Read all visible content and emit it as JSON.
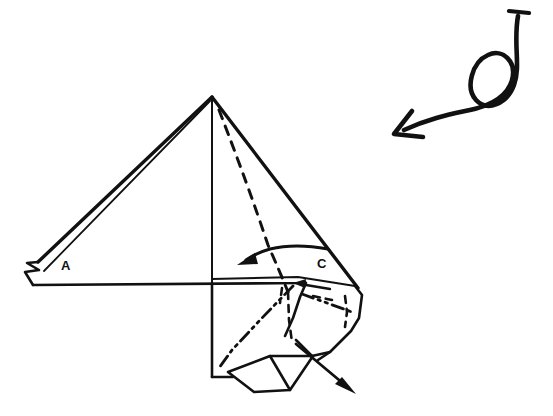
{
  "figure": {
    "kind": "origami-folding-diagram",
    "background_color": "#ffffff",
    "ink_color": "#111111",
    "width": 553,
    "height": 416
  },
  "labels": [
    {
      "name": "point-label-a",
      "text": "A",
      "x": 61,
      "y": 270
    },
    {
      "name": "point-label-c",
      "text": "C",
      "x": 317,
      "y": 268
    }
  ],
  "annotations": {
    "turn_over_arrow": {
      "name": "turn-over-looped-arrow",
      "description": "looped rotate / turn-over arrow",
      "tail_cap": "t-bar",
      "head_style": "open-v",
      "direction": "down-left"
    },
    "fold_arrow": {
      "name": "fold-left-curved-arrow",
      "description": "curved arrow indicating flap folds to the left",
      "head_style": "solid-triangle",
      "direction": "left"
    },
    "pull_arrow": {
      "name": "pull-out-arrow",
      "description": "straight arrow indicating flap pulled out to lower right",
      "head_style": "solid-triangle",
      "direction": "down-right"
    }
  },
  "line_styles": {
    "solid": "existing edge / fold already made",
    "dashed": "hidden edge behind paper",
    "dash_dot_dot": "mountain fold"
  },
  "geometry": {
    "apex": {
      "x": 212,
      "y": 97
    },
    "left_tip": {
      "x": 33,
      "y": 268
    },
    "baseline_left": {
      "x": 33,
      "y": 285
    },
    "right_corner": {
      "x": 358,
      "y": 288
    },
    "bottom_left_corner": {
      "x": 212,
      "y": 377
    }
  }
}
